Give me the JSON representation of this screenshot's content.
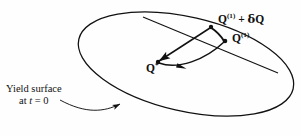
{
  "figure": {
    "domain": "diagram",
    "background_color": "#fefefe",
    "stroke_color": "#111111",
    "caption_font_color": "#111111"
  },
  "labels": {
    "q1_plus_dq": {
      "base": "Q",
      "superscript": "(1)",
      "operator": " + ",
      "delta": "δ",
      "delta_base": "Q",
      "full_text": "Q(1) + δQ"
    },
    "q1": {
      "base": "Q",
      "superscript": "(1)",
      "full_text": "Q(1)"
    },
    "q_star": {
      "base": "Q",
      "superscript": "*",
      "full_text": "Q*"
    },
    "yield_surface": {
      "line1": "Yield surface",
      "line2_prefix": "at ",
      "line2_var": "t",
      "line2_suffix": " = 0",
      "full_text": "Yield surface at t = 0"
    }
  },
  "geometry": {
    "ellipse": {
      "center_x": 186,
      "center_y": 64,
      "radius_x": 110,
      "radius_y": 47,
      "rotation_deg": 13,
      "stroke_width": 1.2
    },
    "nodes": [
      {
        "name": "q-star-node",
        "x": 158,
        "y": 62,
        "radius": 2.1
      },
      {
        "name": "q1-plus-dq-node",
        "x": 211,
        "y": 27,
        "radius": 2.1
      },
      {
        "name": "q1-node",
        "x": 225,
        "y": 41,
        "radius": 2.1
      }
    ],
    "arrows": [
      {
        "name": "arrow-qstar-to-q1",
        "from": "q-star-node",
        "to": "q1-node",
        "style": "curved",
        "direction": "forward"
      },
      {
        "name": "arrow-q1dq-to-qstar",
        "from": "q1-plus-dq-node",
        "to": "q-star-node",
        "style": "straight",
        "direction": "forward"
      },
      {
        "name": "arrow-q1-to-q1dq",
        "from": "q1-node",
        "to": "q1-plus-dq-node",
        "style": "short",
        "direction": "forward"
      },
      {
        "name": "leader-arrow-yield-surface",
        "from": "yield-label",
        "to": "ellipse-boundary",
        "style": "curved",
        "direction": "forward"
      }
    ],
    "tangent_line": {
      "name": "tangent-line",
      "x1": 143,
      "y1": 17,
      "x2": 276,
      "y2": 72
    }
  }
}
